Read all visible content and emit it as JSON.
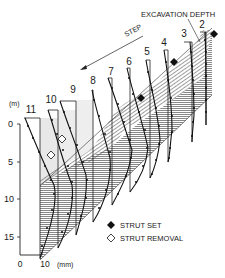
{
  "figure": {
    "labels": {
      "excavation_depth": "EXCAVATION DEPTH",
      "step": "STEP",
      "y_unit": "(m)",
      "x_unit": "(mm)"
    },
    "y_axis": {
      "ticks": [
        "0",
        "5",
        "10",
        "15"
      ]
    },
    "x_scale": {
      "ticks": [
        "0",
        "10"
      ]
    },
    "steps": [
      "11",
      "10",
      "9",
      "8",
      "7",
      "6",
      "5",
      "4",
      "3",
      "2"
    ],
    "legend": {
      "strut_set": "STRUT SET",
      "strut_removal": "STRUT REMOVAL"
    },
    "colors": {
      "ink": "#1a1a1a",
      "hatch": "#555555",
      "light_fill": "#e8e8e8",
      "background": "#ffffff"
    }
  }
}
